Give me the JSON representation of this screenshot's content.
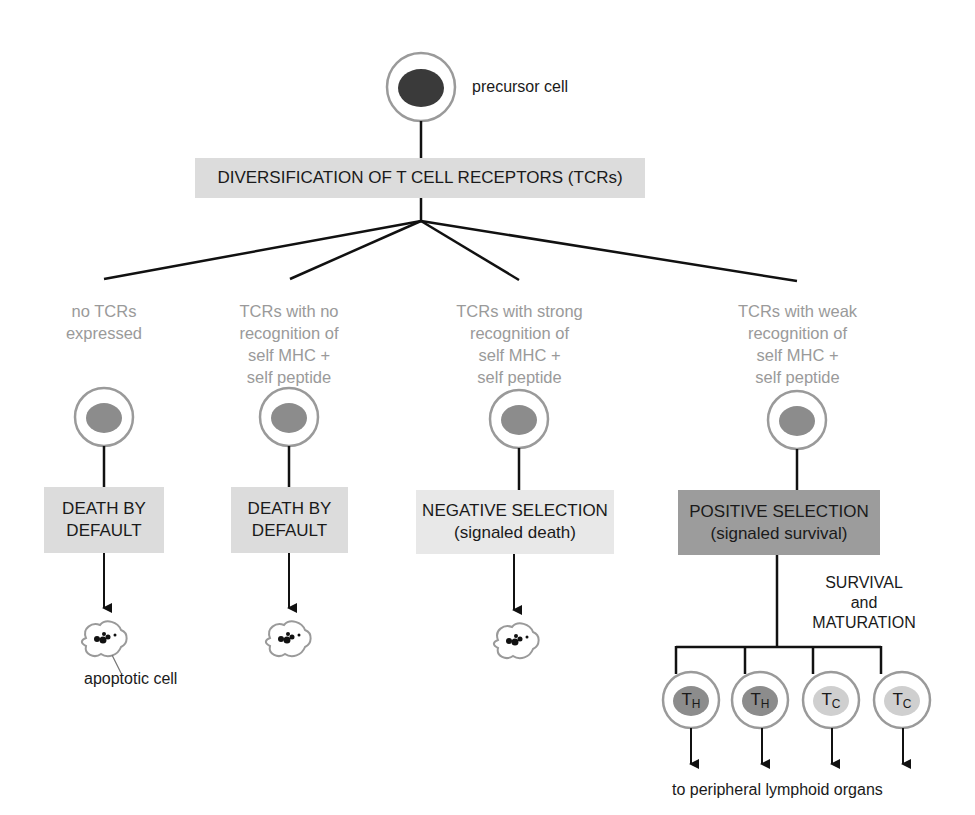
{
  "diagram": {
    "colors": {
      "line": "#111111",
      "cell_outline": "#9a9a9a",
      "nucleus_dark": "#3a3a3a",
      "nucleus_mid": "#8c8c8c",
      "nucleus_light": "#cfcfcf",
      "box_light": "#dcdcdc",
      "box_lighter": "#e8e8e8",
      "box_dark": "#9c9c9c",
      "muted_text": "#9a9a9a"
    },
    "top": {
      "cell_label": "precursor cell",
      "process_box": "DIVERSIFICATION OF T CELL RECEPTORS (TCRs)"
    },
    "branches": [
      {
        "condition": [
          "no TCRs",
          "expressed"
        ],
        "outcome": [
          "DEATH BY",
          "DEFAULT"
        ],
        "result": "apoptotic cell"
      },
      {
        "condition": [
          "TCRs with no",
          "recognition of",
          "self MHC +",
          "self peptide"
        ],
        "outcome": [
          "DEATH BY",
          "DEFAULT"
        ],
        "result": "apoptotic cell"
      },
      {
        "condition": [
          "TCRs with strong",
          "recognition of",
          "self MHC +",
          "self peptide"
        ],
        "outcome": [
          "NEGATIVE SELECTION",
          "(signaled death)"
        ],
        "result": "apoptotic cell"
      },
      {
        "condition": [
          "TCRs with weak",
          "recognition of",
          "self MHC +",
          "self peptide"
        ],
        "outcome": [
          "POSITIVE SELECTION",
          "(signaled survival)"
        ],
        "result": "mature T cells"
      }
    ],
    "apoptotic_label": "apoptotic cell",
    "survival_label": [
      "SURVIVAL",
      "and",
      "MATURATION"
    ],
    "mature_cells": [
      {
        "main": "T",
        "sub": "H"
      },
      {
        "main": "T",
        "sub": "H"
      },
      {
        "main": "T",
        "sub": "C"
      },
      {
        "main": "T",
        "sub": "C"
      }
    ],
    "destination": "to peripheral lymphoid organs"
  }
}
